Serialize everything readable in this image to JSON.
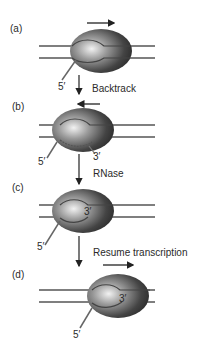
{
  "panels": [
    {
      "id": "a",
      "label": "(a)",
      "five_prime": "5′",
      "three_prime": ""
    },
    {
      "id": "b",
      "label": "(b)",
      "five_prime": "5′",
      "three_prime": "3′"
    },
    {
      "id": "c",
      "label": "(c)",
      "five_prime": "5′",
      "three_prime": "3′"
    },
    {
      "id": "d",
      "label": "(d)",
      "five_prime": "5′",
      "three_prime": "3′"
    }
  ],
  "steps": [
    {
      "from": "a",
      "to": "b",
      "label": "Backtrack",
      "direction": "left"
    },
    {
      "from": "b",
      "to": "c",
      "label": "RNase",
      "direction": ""
    },
    {
      "from": "c",
      "to": "d",
      "label": "Resume transcription",
      "direction": "right"
    }
  ],
  "colors": {
    "dna": "#555555",
    "polymerase_dark": "#2e2e2e",
    "polymerase_light": "#e6e6e6",
    "text": "#2a2a2a"
  }
}
